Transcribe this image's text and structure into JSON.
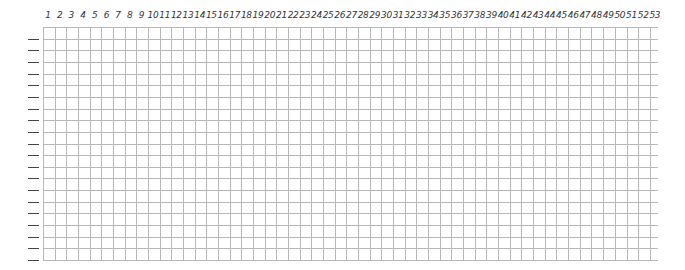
{
  "sheet": {
    "column_labels": [
      "1",
      "2",
      "3",
      "4",
      "5",
      "6",
      "7",
      "8",
      "9",
      "10",
      "11",
      "12",
      "13",
      "14",
      "15",
      "16",
      "17",
      "18",
      "19",
      "20",
      "21",
      "22",
      "23",
      "24",
      "25",
      "26",
      "27",
      "28",
      "29",
      "30",
      "31",
      "32",
      "33",
      "34",
      "35",
      "36",
      "37",
      "38",
      "39",
      "40",
      "41",
      "42",
      "43",
      "44",
      "45",
      "46",
      "47",
      "48",
      "49",
      "50",
      "51",
      "52",
      "53"
    ],
    "row_count": 20,
    "grid_color": "#b8b8b8",
    "dash_color": "#444444"
  }
}
